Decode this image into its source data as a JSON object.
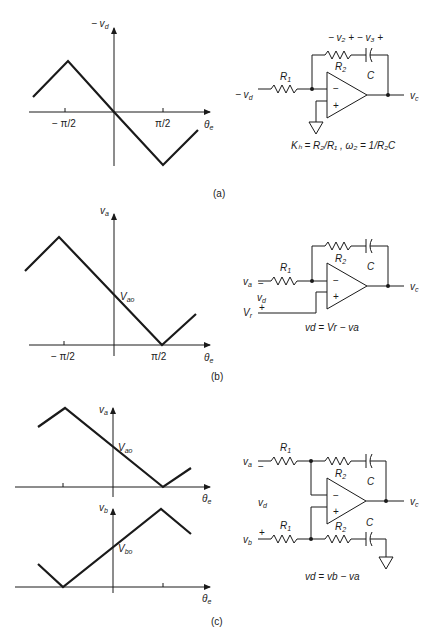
{
  "panels": [
    {
      "id": "a",
      "label": "(a)",
      "graph": {
        "y_axis_label": "− v",
        "y_axis_sub": "d",
        "x_axis_label": "θ",
        "x_axis_sub": "e",
        "ticks": [
          "− π/2",
          "π/2"
        ]
      },
      "circuit": {
        "input_label": "− v",
        "input_sub": "d",
        "R1": "R",
        "R1_sub": "1",
        "R2": "R",
        "R2_sub": "2",
        "C": "C",
        "output_label": "v",
        "output_sub": "c",
        "feedback_voltages": "− v₂ + − v₃ +",
        "opamp_minus": "−",
        "opamp_plus": "+",
        "equation": "Kₕ = R₂/R₁ , ω₂ = 1/R₂C"
      }
    },
    {
      "id": "b",
      "label": "(b)",
      "graph": {
        "y_axis_label": "v",
        "y_axis_sub": "a",
        "x_axis_label": "θ",
        "x_axis_sub": "e",
        "ticks": [
          "− π/2",
          "π/2"
        ],
        "intercept_label": "V",
        "intercept_sub": "ao"
      },
      "circuit": {
        "input_a": "v",
        "input_a_sub": "a",
        "input_a_sign": "−",
        "input_d": "v",
        "input_d_sub": "d",
        "input_r": "V",
        "input_r_sub": "r",
        "input_r_sign": "+",
        "R1": "R",
        "R1_sub": "1",
        "R2": "R",
        "R2_sub": "2",
        "C": "C",
        "output_label": "v",
        "output_sub": "c",
        "opamp_minus": "−",
        "opamp_plus": "+",
        "equation": "vᵈ = Vᵣ − vₐ",
        "equation_display": "vd = Vr − va"
      }
    },
    {
      "id": "c",
      "label": "(c)",
      "graph_top": {
        "y_axis_label": "v",
        "y_axis_sub": "a",
        "x_axis_label": "θ",
        "x_axis_sub": "e",
        "intercept_label": "V",
        "intercept_sub": "ao"
      },
      "graph_bottom": {
        "y_axis_label": "v",
        "y_axis_sub": "b",
        "x_axis_label": "θ",
        "x_axis_sub": "e",
        "intercept_label": "V",
        "intercept_sub": "bo"
      },
      "circuit": {
        "input_a": "v",
        "input_a_sub": "a",
        "input_a_sign": "−",
        "input_d": "v",
        "input_d_sub": "d",
        "input_b": "v",
        "input_b_sub": "b",
        "input_b_sign": "+",
        "R1": "R",
        "R1_sub": "1",
        "R2": "R",
        "R2_sub": "2",
        "C": "C",
        "output_label": "v",
        "output_sub": "c",
        "opamp_minus": "−",
        "opamp_plus": "+",
        "equation_display": "vd = vb − va"
      }
    }
  ]
}
